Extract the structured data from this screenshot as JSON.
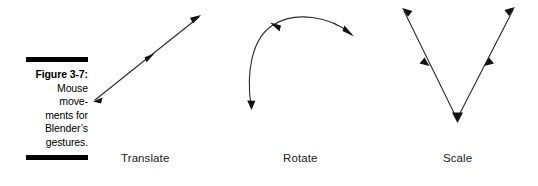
{
  "figure": {
    "caption_lines": [
      {
        "text": "Figure 3-7:",
        "bold": true
      },
      {
        "text": "Mouse",
        "bold": false
      },
      {
        "text": "move-",
        "bold": false
      },
      {
        "text": "ments for",
        "bold": false
      },
      {
        "text": "Blender’s",
        "bold": false
      },
      {
        "text": "gestures.",
        "bold": false
      }
    ],
    "caption_full": "Figure 3-7: Mouse movements for Blender’s gestures.",
    "background_color": "#ffffff",
    "rule_color": "#000000",
    "stroke_color": "#2b2b2b",
    "label_color": "#1a1a1a"
  },
  "diagrams": [
    {
      "id": "translate",
      "label": "Translate",
      "gesture": "straight diagonal stroke from lower-left to upper-right",
      "arrowheads": 3
    },
    {
      "id": "rotate",
      "label": "Rotate",
      "gesture": "curved arc sweeping from upper-right over the top and down to lower-left",
      "arrowheads": 3
    },
    {
      "id": "scale",
      "label": "Scale",
      "gesture": "V shape descending from upper-left to a bottom vertex then ascending to upper-right",
      "arrowheads": 5
    }
  ]
}
